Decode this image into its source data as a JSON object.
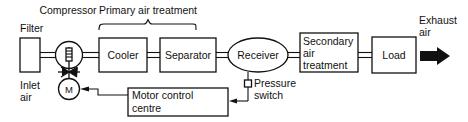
{
  "diagram": {
    "captions": {
      "compressor": "Compressor",
      "primary_air_treatment": "Primary air treatment",
      "filter": "Filter",
      "inlet_air": "Inlet\nair",
      "inlet_air_line1": "Inlet",
      "inlet_air_line2": "air",
      "exhaust_air_line1": "Exhaust",
      "exhaust_air_line2": "air",
      "pressure_switch_line1": "Pressure",
      "pressure_switch_line2": "switch"
    },
    "blocks": [
      {
        "id": "filter",
        "label": "",
        "shape": "rect"
      },
      {
        "id": "compressor",
        "label": "",
        "shape": "circle"
      },
      {
        "id": "motor",
        "label": "M",
        "shape": "circle"
      },
      {
        "id": "cooler",
        "label": "Cooler",
        "shape": "rect"
      },
      {
        "id": "separator",
        "label": "Separator",
        "shape": "rect"
      },
      {
        "id": "receiver",
        "label": "Receiver",
        "shape": "oval"
      },
      {
        "id": "secondary-air-treatment",
        "label_line1": "Secondary",
        "label_line2": "air",
        "label_line3": "treatment",
        "shape": "rect"
      },
      {
        "id": "load",
        "label": "Load",
        "shape": "rect"
      },
      {
        "id": "motor-control-centre",
        "label_line1": "Motor control",
        "label_line2": "centre",
        "shape": "rect"
      }
    ],
    "colors": {
      "line": "#111111",
      "background": "#ffffff",
      "text": "#111111"
    }
  }
}
